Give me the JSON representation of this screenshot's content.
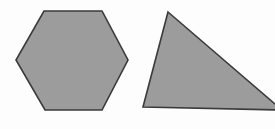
{
  "canvas": {
    "width": 275,
    "height": 129,
    "background_color": "#fdfdfd",
    "description": "Two filled gray geometric shapes on a plain white background"
  },
  "style": {
    "fill_color": "#9c9c9c",
    "stroke_color": "#3a3a3a",
    "stroke_width": 1.6
  },
  "shapes": [
    {
      "id": "hexagon",
      "name": "regular-hexagon",
      "label": "Hexagon",
      "sides": 6,
      "fill_color": "#9c9c9c",
      "stroke_color": "#3a3a3a",
      "points": "44,11 102,11 128,60 102,110 45,110 16,60",
      "bbox": {
        "x": 16,
        "y": 11,
        "width": 112,
        "height": 99
      }
    },
    {
      "id": "triangle",
      "name": "scalene-triangle",
      "label": "Triangle",
      "sides": 3,
      "fill_color": "#9c9c9c",
      "stroke_color": "#3a3a3a",
      "points": "168,12 282,110 143,107",
      "bbox": {
        "x": 143,
        "y": 12,
        "width": 139,
        "height": 98
      },
      "clipped_edge": "right"
    }
  ]
}
